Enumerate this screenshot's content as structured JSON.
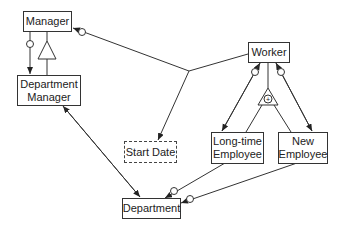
{
  "diagram": {
    "entities": {
      "manager": "Manager",
      "department_manager": "Department Manager",
      "worker": "Worker",
      "start_date": "Start Date",
      "long_time_employee": "Long-time Employee",
      "new_employee": "New Employee",
      "department": "Department"
    },
    "generalization_symbols": {
      "manager_triangle": "triangle",
      "worker_triangle_marker": "+"
    },
    "colors": {
      "line": "#333333",
      "background": "#ffffff"
    }
  }
}
